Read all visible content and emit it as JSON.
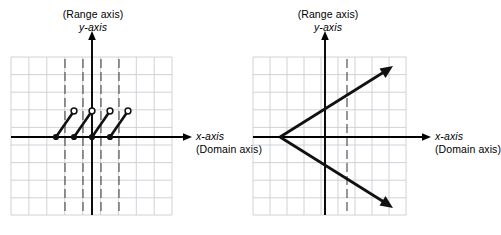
{
  "figure": {
    "title": "",
    "panels": [
      {
        "id": "left",
        "name": "step-function-graph",
        "labels": {
          "range_axis": "(Range axis)",
          "y_axis": "y-axis",
          "x_axis": "x-axis",
          "domain_axis": "(Domain axis)"
        },
        "grid": {
          "left": 11,
          "top": 57,
          "right": 172,
          "bottom": 215,
          "cell": 17.9,
          "cols": 9,
          "rows": 9,
          "color": "#c9cdd4"
        },
        "axes": {
          "x_axis_y": 137,
          "y_axis_x": 92,
          "x_axis_start": 11,
          "x_axis_end": 192,
          "y_axis_top": 33,
          "y_axis_bottom": 215,
          "color": "#000000"
        },
        "dashed_lines_x": [
          65,
          83,
          101,
          119
        ],
        "dashed_top": 59,
        "dashed_bottom": 214,
        "segments": [
          {
            "x1": 56,
            "y1": 137,
            "x2": 74,
            "y2": 111,
            "closed_start": true,
            "open_end": true
          },
          {
            "x1": 74,
            "y1": 137,
            "x2": 92,
            "y2": 111,
            "closed_start": true,
            "open_end": true
          },
          {
            "x1": 92,
            "y1": 137,
            "x2": 110,
            "y2": 111,
            "closed_start": true,
            "open_end": true
          },
          {
            "x1": 110,
            "y1": 137,
            "x2": 128,
            "y2": 111,
            "closed_start": true,
            "open_end": true
          }
        ]
      },
      {
        "id": "right",
        "name": "sideways-parabola-graph",
        "labels": {
          "range_axis": "(Range axis)",
          "y_axis": "y-axis",
          "x_axis": "x-axis",
          "domain_axis": "(Domain axis)"
        },
        "grid": {
          "left": 10,
          "top": 57,
          "right": 163,
          "bottom": 215,
          "cell": 17.0,
          "cols": 9,
          "rows": 9,
          "color": "#c9cdd4"
        },
        "axes": {
          "x_axis_y": 137,
          "y_axis_x": 82,
          "x_axis_start": 10,
          "x_axis_end": 188,
          "y_axis_top": 33,
          "y_axis_bottom": 215,
          "color": "#000000"
        },
        "dashed_lines_x": [
          104
        ],
        "dashed_top": 59,
        "dashed_bottom": 214,
        "vertex": {
          "x": 37,
          "y": 137
        },
        "rays": [
          {
            "x1": 37,
            "y1": 137,
            "x2": 145,
            "y2": 70,
            "arrow": true
          },
          {
            "x1": 37,
            "y1": 137,
            "x2": 145,
            "y2": 204,
            "arrow": true
          }
        ]
      }
    ],
    "colors": {
      "grid": "#c9cdd4",
      "axis": "#000000",
      "curve": "#1a1a1a",
      "dashed": "#4d4d4d",
      "background": "#ffffff"
    }
  }
}
